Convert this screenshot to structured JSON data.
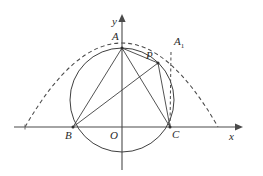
{
  "figure": {
    "background_color": "#ffffff",
    "stroke_color": "#3f3f3f",
    "axis_color": "#4a4a4a",
    "axes": {
      "x_label": "x",
      "y_label": "y",
      "origin_label": "O",
      "x_axis_y": 127,
      "y_axis_x": 122,
      "x_start": 14,
      "x_end": 243,
      "y_top": 14,
      "y_bottom": 170
    },
    "points": [
      {
        "name": "A",
        "label": "A",
        "x": 122,
        "y": 48,
        "label_x": 112,
        "label_y": 31,
        "dot": true
      },
      {
        "name": "B",
        "label": "B",
        "x": 73,
        "y": 127,
        "label_x": 65,
        "label_y": 130,
        "dot": true
      },
      {
        "name": "C",
        "label": "C",
        "x": 170,
        "y": 127,
        "label_x": 172,
        "label_y": 129,
        "dot": true
      },
      {
        "name": "O",
        "label": "O",
        "x": 122,
        "y": 127,
        "label_x": 110,
        "label_y": 130,
        "dot": false
      },
      {
        "name": "P",
        "label": "P",
        "x": 158,
        "y": 63,
        "label_x": 146,
        "label_y": 50,
        "dot": true
      },
      {
        "name": "A1",
        "label": "A",
        "sub": "1",
        "x": 171,
        "y": 52,
        "label_x": 174,
        "label_y": 36,
        "dot": false
      }
    ],
    "circle": {
      "center_x": 122,
      "center_y": 100,
      "radius": 52,
      "style": "solid",
      "passes_through": [
        "A",
        "B",
        "C"
      ]
    },
    "dashed_arc": {
      "description": "parabolic arc through apex above A spanning beyond B and C",
      "left_x": 25,
      "right_x": 218,
      "baseline_y": 127,
      "apex_x": 122,
      "apex_y": 43,
      "style": "dashed"
    },
    "segments": [
      {
        "from": "A",
        "to": "B",
        "style": "solid"
      },
      {
        "from": "A",
        "to": "C",
        "style": "solid"
      },
      {
        "from": "A",
        "to": "P",
        "style": "solid"
      },
      {
        "from": "B",
        "to": "P",
        "style": "solid"
      },
      {
        "from": "P",
        "to": "C",
        "style": "solid"
      },
      {
        "from": "A1",
        "to": "C",
        "style": "dashed"
      }
    ],
    "tick_marks": [
      {
        "axis": "x",
        "x": 25
      }
    ]
  }
}
